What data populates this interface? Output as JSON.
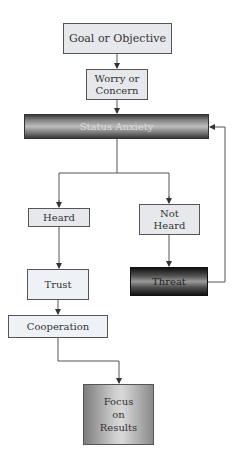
{
  "diagram": {
    "nodes": {
      "goal": "Goal or Objective",
      "worry": "Worry or Concern",
      "status_anxiety": "Status Anxiety",
      "heard": "Heard",
      "not_heard": "Not Heard",
      "trust": "Trust",
      "threat": "Threat",
      "cooperation": "Cooperation",
      "focus": "Focus on Results"
    },
    "edges": [
      {
        "from": "goal",
        "to": "worry"
      },
      {
        "from": "worry",
        "to": "status_anxiety"
      },
      {
        "from": "status_anxiety",
        "to": "heard"
      },
      {
        "from": "status_anxiety",
        "to": "not_heard"
      },
      {
        "from": "heard",
        "to": "trust"
      },
      {
        "from": "not_heard",
        "to": "threat"
      },
      {
        "from": "threat",
        "to": "status_anxiety"
      },
      {
        "from": "trust",
        "to": "cooperation"
      },
      {
        "from": "cooperation",
        "to": "focus"
      }
    ]
  }
}
